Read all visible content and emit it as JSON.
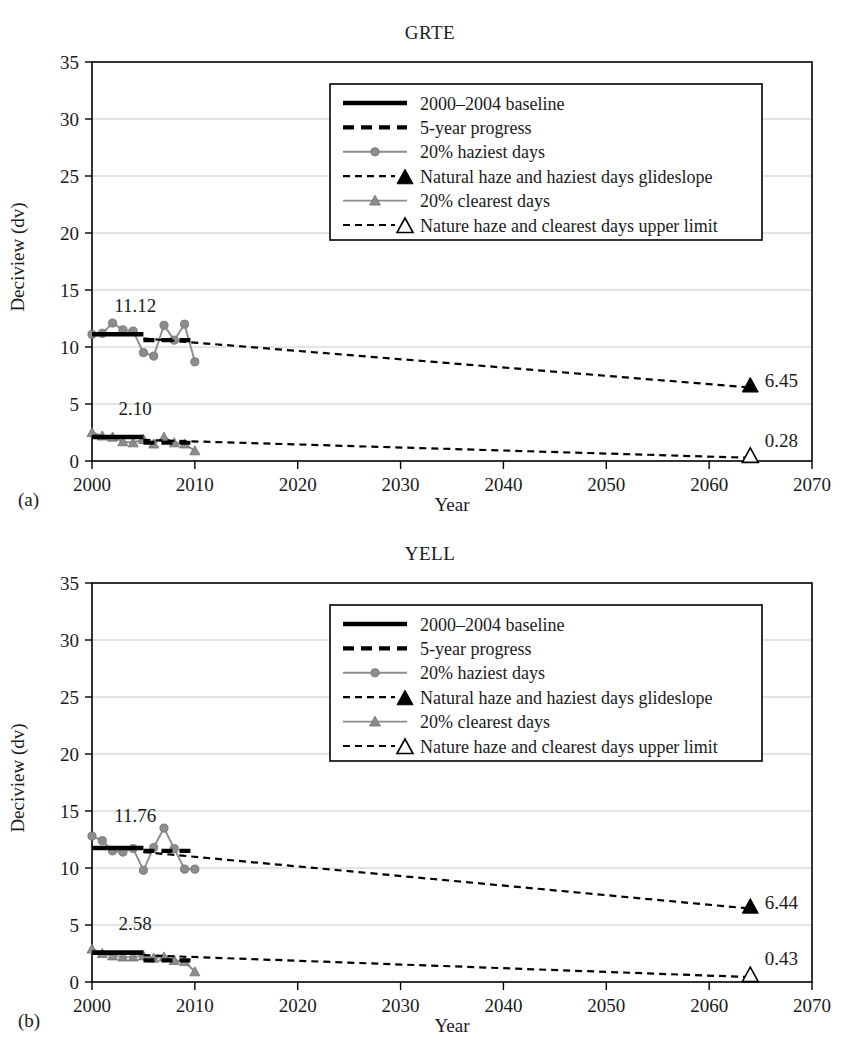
{
  "figure": {
    "ylabel": "Deciview (dv)",
    "xlabel": "Year",
    "panel_a_label": "(a)",
    "panel_b_label": "(b)"
  },
  "legend": {
    "items": [
      {
        "key": "baseline",
        "label": "2000–2004 baseline"
      },
      {
        "key": "progress",
        "label": "5-year progress"
      },
      {
        "key": "haziest",
        "label": "20% haziest days"
      },
      {
        "key": "glide_haziest",
        "label": "Natural haze and haziest days glideslope"
      },
      {
        "key": "clearest",
        "label": "20% clearest days"
      },
      {
        "key": "glide_clearest",
        "label": "Nature haze and clearest days upper limit"
      }
    ]
  },
  "colors": {
    "series_gray": "#8c8c8c",
    "black": "#000000",
    "grid": "#c9c9c9",
    "background": "#ffffff"
  },
  "chart_data": [
    {
      "type": "line",
      "panel": "(a)",
      "title": "GRTE",
      "xlabel": "Year",
      "ylabel": "Deciview (dv)",
      "xlim": [
        2000,
        2070
      ],
      "ylim": [
        0,
        35
      ],
      "xticks": [
        2000,
        2010,
        2020,
        2030,
        2040,
        2050,
        2060,
        2070
      ],
      "yticks": [
        0,
        5,
        10,
        15,
        20,
        25,
        30,
        35
      ],
      "grid": "horizontal",
      "legend_position": "top-center-right",
      "annotations": [
        {
          "text": "11.12",
          "x": 2004.2,
          "y": 13.1,
          "meaning": "haziest-days baseline value"
        },
        {
          "text": "2.10",
          "x": 2004.2,
          "y": 4.0,
          "meaning": "clearest-days baseline value"
        },
        {
          "text": "6.45",
          "x": 2065.4,
          "y": 6.45,
          "meaning": "haziest-days natural haze endpoint"
        },
        {
          "text": "0.28",
          "x": 2065.4,
          "y": 1.25,
          "meaning": "clearest-days natural haze endpoint"
        }
      ],
      "series": [
        {
          "name": "20% haziest days",
          "style": "gray-line-circles",
          "x": [
            2000,
            2001,
            2002,
            2003,
            2004,
            2005,
            2006,
            2007,
            2008,
            2009,
            2010
          ],
          "values": [
            11.1,
            11.2,
            12.1,
            11.5,
            11.4,
            9.5,
            9.2,
            11.9,
            10.6,
            12.0,
            8.7
          ]
        },
        {
          "name": "20% clearest days",
          "style": "gray-line-triangles",
          "x": [
            2000,
            2001,
            2002,
            2003,
            2004,
            2005,
            2006,
            2007,
            2008,
            2009,
            2010
          ],
          "values": [
            2.5,
            2.2,
            2.1,
            1.7,
            1.6,
            1.9,
            1.5,
            2.1,
            1.6,
            1.5,
            0.9
          ]
        },
        {
          "name": "2000-2004 baseline (haziest)",
          "style": "thick-black",
          "x": [
            2000,
            2005
          ],
          "values": [
            11.12,
            11.12
          ]
        },
        {
          "name": "5-year progress (haziest)",
          "style": "thick-black-dashed",
          "x": [
            2005,
            2010
          ],
          "values": [
            10.6,
            10.6
          ]
        },
        {
          "name": "Natural haze and haziest days glideslope",
          "style": "dashed-black",
          "x": [
            2005,
            2064
          ],
          "values": [
            10.75,
            6.45
          ]
        },
        {
          "name": "2000-2004 baseline (clearest)",
          "style": "thick-black",
          "x": [
            2000,
            2005
          ],
          "values": [
            2.1,
            2.1
          ]
        },
        {
          "name": "5-year progress (clearest)",
          "style": "thick-black-dashed",
          "x": [
            2005,
            2010
          ],
          "values": [
            1.6,
            1.6
          ]
        },
        {
          "name": "Nature haze and clearest days upper limit",
          "style": "dashed-black",
          "x": [
            2005,
            2064
          ],
          "values": [
            1.85,
            0.28
          ]
        }
      ],
      "endpoints": [
        {
          "marker": "filled-triangle",
          "x": 2064,
          "y": 6.45,
          "label": "6.45"
        },
        {
          "marker": "open-triangle",
          "x": 2064,
          "y": 0.28,
          "label": "0.28"
        }
      ]
    },
    {
      "type": "line",
      "panel": "(b)",
      "title": "YELL",
      "xlabel": "Year",
      "ylabel": "Deciview (dv)",
      "xlim": [
        2000,
        2070
      ],
      "ylim": [
        0,
        35
      ],
      "xticks": [
        2000,
        2010,
        2020,
        2030,
        2040,
        2050,
        2060,
        2070
      ],
      "yticks": [
        0,
        5,
        10,
        15,
        20,
        25,
        30,
        35
      ],
      "grid": "horizontal",
      "legend_position": "top-center-right",
      "annotations": [
        {
          "text": "11.76",
          "x": 2004.2,
          "y": 14.0,
          "meaning": "haziest-days baseline value"
        },
        {
          "text": "2.58",
          "x": 2004.2,
          "y": 4.6,
          "meaning": "clearest-days baseline value"
        },
        {
          "text": "6.44",
          "x": 2065.4,
          "y": 6.44,
          "meaning": "haziest-days natural haze endpoint"
        },
        {
          "text": "0.43",
          "x": 2065.4,
          "y": 1.45,
          "meaning": "clearest-days natural haze endpoint"
        }
      ],
      "series": [
        {
          "name": "20% haziest days",
          "style": "gray-line-circles",
          "x": [
            2000,
            2001,
            2002,
            2003,
            2004,
            2005,
            2006,
            2007,
            2008,
            2009,
            2010
          ],
          "values": [
            12.8,
            12.4,
            11.5,
            11.4,
            11.7,
            9.8,
            11.8,
            13.5,
            11.7,
            9.9,
            9.9
          ]
        },
        {
          "name": "20% clearest days",
          "style": "gray-line-triangles",
          "x": [
            2000,
            2001,
            2002,
            2003,
            2004,
            2005,
            2006,
            2007,
            2008,
            2009,
            2010
          ],
          "values": [
            2.9,
            2.5,
            2.3,
            2.2,
            2.2,
            2.3,
            2.1,
            2.2,
            1.9,
            1.8,
            0.9
          ]
        },
        {
          "name": "2000-2004 baseline (haziest)",
          "style": "thick-black",
          "x": [
            2000,
            2005
          ],
          "values": [
            11.76,
            11.76
          ]
        },
        {
          "name": "5-year progress (haziest)",
          "style": "thick-black-dashed",
          "x": [
            2005,
            2010
          ],
          "values": [
            11.5,
            11.5
          ]
        },
        {
          "name": "Natural haze and haziest days glideslope",
          "style": "dashed-black",
          "x": [
            2005,
            2064
          ],
          "values": [
            11.4,
            6.44
          ]
        },
        {
          "name": "2000-2004 baseline (clearest)",
          "style": "thick-black",
          "x": [
            2000,
            2005
          ],
          "values": [
            2.58,
            2.58
          ]
        },
        {
          "name": "5-year progress (clearest)",
          "style": "thick-black-dashed",
          "x": [
            2005,
            2010
          ],
          "values": [
            1.9,
            1.9
          ]
        },
        {
          "name": "Nature haze and clearest days upper limit",
          "style": "dashed-black",
          "x": [
            2005,
            2064
          ],
          "values": [
            2.35,
            0.43
          ]
        }
      ],
      "endpoints": [
        {
          "marker": "filled-triangle",
          "x": 2064,
          "y": 6.44,
          "label": "6.44"
        },
        {
          "marker": "open-triangle",
          "x": 2064,
          "y": 0.43,
          "label": "0.43"
        }
      ]
    }
  ]
}
